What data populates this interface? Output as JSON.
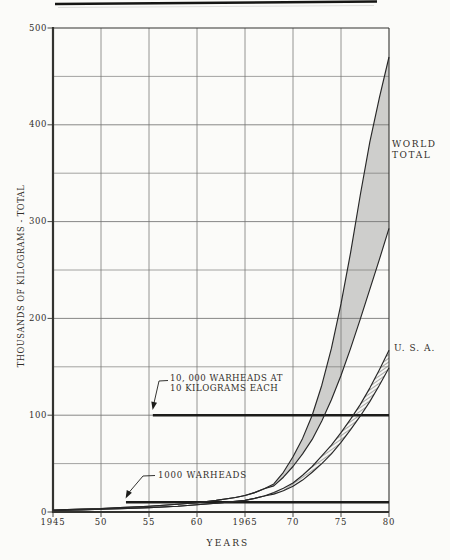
{
  "chart_data": {
    "type": "area",
    "title": "",
    "xlabel": "YEARS",
    "ylabel": "THOUSANDS OF KILOGRAMS - TOTAL",
    "xlim": [
      1945,
      1980
    ],
    "ylim": [
      0,
      500
    ],
    "grid": true,
    "grid_step_y": 50,
    "x_major_ticks": [
      1945,
      1950,
      1955,
      1960,
      1965,
      1970,
      1975,
      1980
    ],
    "x_tick_labels": [
      "1945",
      "50",
      "55",
      "60",
      "1965",
      "70",
      "75",
      "80"
    ],
    "y_major_ticks": [
      0,
      100,
      200,
      300,
      400,
      500
    ],
    "y_tick_labels": [
      "0",
      "100",
      "200",
      "300",
      "400",
      "500"
    ],
    "series": [
      {
        "name": "world-total-upper",
        "points": [
          [
            1945,
            2
          ],
          [
            1948,
            3
          ],
          [
            1950,
            3.5
          ],
          [
            1952,
            4.5
          ],
          [
            1955,
            6
          ],
          [
            1958,
            8
          ],
          [
            1960,
            9.5
          ],
          [
            1962,
            12
          ],
          [
            1964,
            15
          ],
          [
            1965,
            17
          ],
          [
            1966,
            20
          ],
          [
            1967,
            24
          ],
          [
            1968,
            29
          ],
          [
            1969,
            41
          ],
          [
            1970,
            57
          ],
          [
            1971,
            76
          ],
          [
            1972,
            100
          ],
          [
            1973,
            131
          ],
          [
            1974,
            169
          ],
          [
            1975,
            215
          ],
          [
            1976,
            268
          ],
          [
            1977,
            327
          ],
          [
            1978,
            382
          ],
          [
            1979,
            428
          ],
          [
            1980,
            470
          ]
        ]
      },
      {
        "name": "world-total-lower",
        "points": [
          [
            1945,
            2
          ],
          [
            1948,
            3
          ],
          [
            1950,
            3.5
          ],
          [
            1952,
            4.5
          ],
          [
            1955,
            6
          ],
          [
            1958,
            8
          ],
          [
            1960,
            9.5
          ],
          [
            1962,
            12
          ],
          [
            1964,
            15
          ],
          [
            1965,
            17
          ],
          [
            1966,
            20
          ],
          [
            1967,
            24
          ],
          [
            1968,
            27
          ],
          [
            1969,
            36
          ],
          [
            1970,
            47
          ],
          [
            1971,
            60
          ],
          [
            1972,
            75
          ],
          [
            1973,
            94
          ],
          [
            1974,
            116
          ],
          [
            1975,
            141
          ],
          [
            1976,
            169
          ],
          [
            1977,
            199
          ],
          [
            1978,
            230
          ],
          [
            1979,
            261
          ],
          [
            1980,
            293
          ]
        ]
      },
      {
        "name": "usa-upper",
        "points": [
          [
            1945,
            1.5
          ],
          [
            1948,
            2.2
          ],
          [
            1950,
            2.8
          ],
          [
            1952,
            3.5
          ],
          [
            1955,
            4.5
          ],
          [
            1958,
            6
          ],
          [
            1960,
            7.5
          ],
          [
            1962,
            9
          ],
          [
            1964,
            11
          ],
          [
            1965,
            12
          ],
          [
            1966,
            14
          ],
          [
            1967,
            16.5
          ],
          [
            1968,
            20
          ],
          [
            1969,
            24.5
          ],
          [
            1970,
            30
          ],
          [
            1971,
            38
          ],
          [
            1972,
            47
          ],
          [
            1973,
            58
          ],
          [
            1974,
            69
          ],
          [
            1975,
            82
          ],
          [
            1976,
            96
          ],
          [
            1977,
            111
          ],
          [
            1978,
            128
          ],
          [
            1979,
            147
          ],
          [
            1980,
            167
          ]
        ]
      },
      {
        "name": "usa-lower",
        "points": [
          [
            1945,
            1.5
          ],
          [
            1948,
            2.2
          ],
          [
            1950,
            2.8
          ],
          [
            1952,
            3.5
          ],
          [
            1955,
            4.5
          ],
          [
            1958,
            6
          ],
          [
            1960,
            7.5
          ],
          [
            1962,
            9
          ],
          [
            1964,
            11
          ],
          [
            1965,
            12
          ],
          [
            1966,
            14
          ],
          [
            1967,
            16.5
          ],
          [
            1968,
            18.5
          ],
          [
            1969,
            22
          ],
          [
            1970,
            26.5
          ],
          [
            1971,
            33
          ],
          [
            1972,
            41
          ],
          [
            1973,
            50
          ],
          [
            1974,
            60
          ],
          [
            1975,
            72
          ],
          [
            1976,
            85
          ],
          [
            1977,
            99
          ],
          [
            1978,
            114
          ],
          [
            1979,
            131
          ],
          [
            1980,
            149
          ]
        ]
      }
    ],
    "bands": [
      {
        "name": "world-total-band",
        "upper": "world-total-upper",
        "lower": "world-total-lower",
        "fill": "#c9c9c7"
      },
      {
        "name": "usa-band",
        "upper": "usa-upper",
        "lower": "usa-lower",
        "fill": "hatch"
      }
    ],
    "reference_lines": [
      {
        "name": "warheads-10000-line",
        "value": 100,
        "x_start": 1955.4,
        "label_lines": [
          "10, 000 WARHEADS AT",
          "10 KILOGRAMS EACH"
        ]
      },
      {
        "name": "warheads-1000-line",
        "value": 10,
        "x_start": 1952.6,
        "label_lines": [
          "1000 WARHEADS"
        ]
      }
    ],
    "series_labels": {
      "world": [
        "WORLD",
        "TOTAL"
      ],
      "usa": "U. S. A."
    },
    "colors": {
      "band_gray": "#c9c9c7",
      "curve": "#272727",
      "grid": "#737371",
      "axis": "#333330",
      "ref_line": "#1c1c1a",
      "text": "#322e29",
      "background": "#fbfbf9"
    }
  }
}
